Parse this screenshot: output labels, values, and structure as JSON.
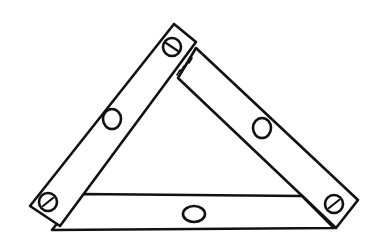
{
  "diagram": {
    "title": "",
    "colors": {
      "ink": "#111111",
      "fill": "#ffffff",
      "background": "#ffffff"
    },
    "strips": [
      {
        "id": "left-strip",
        "holes": 1
      },
      {
        "id": "right-strip",
        "holes": 1
      },
      {
        "id": "bottom-strip",
        "holes": 1
      }
    ],
    "bolts": [
      {
        "id": "top-bolt",
        "x": 172,
        "y": 47
      },
      {
        "id": "bottom-left-bolt",
        "x": 48,
        "y": 202
      },
      {
        "id": "bottom-right-bolt",
        "x": 334,
        "y": 204
      }
    ],
    "holes": [
      {
        "id": "left-strip-hole",
        "x": 112,
        "y": 119
      },
      {
        "id": "right-strip-hole",
        "x": 262,
        "y": 128
      },
      {
        "id": "bottom-strip-hole",
        "x": 194,
        "y": 214
      }
    ]
  }
}
